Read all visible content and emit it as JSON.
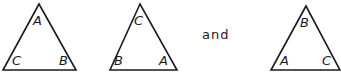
{
  "diagram": {
    "connector_word": "and",
    "triangles": [
      {
        "top": "A",
        "bottom_left": "C",
        "bottom_right": "B"
      },
      {
        "top": "C",
        "bottom_left": "B",
        "bottom_right": "A"
      },
      {
        "top": "B",
        "bottom_left": "A",
        "bottom_right": "C"
      }
    ]
  },
  "colors": {
    "line": "#1a1a1a",
    "background": "#ffffff"
  }
}
